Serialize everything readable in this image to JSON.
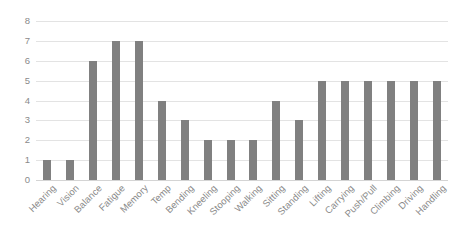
{
  "chart_data": {
    "type": "bar",
    "title": "",
    "subtitle": "",
    "xlabel": "",
    "ylabel": "",
    "categories": [
      "Hearing",
      "Vision",
      "Balance",
      "Fatigue",
      "Memory",
      "Temp",
      "Bending",
      "Kneeling",
      "Stooping",
      "Walking",
      "Sitting",
      "Standing",
      "Lifting",
      "Carrying",
      "Push/Pull",
      "Climbing",
      "Driving",
      "Handling"
    ],
    "values": [
      1,
      1,
      6,
      7,
      7,
      4,
      3,
      2,
      2,
      2,
      4,
      3,
      5,
      5,
      5,
      5,
      5,
      5
    ],
    "ylim": [
      0,
      8
    ],
    "ytick_labels": [
      "8",
      "7",
      "6",
      "5",
      "4",
      "3",
      "2",
      "1",
      "0"
    ],
    "ytick_values": [
      8,
      7,
      6,
      5,
      4,
      3,
      2,
      1,
      0
    ],
    "grid": true,
    "grid_axis": "y",
    "legend": false,
    "legend_position": "none",
    "bar_color": "#808080",
    "grid_color": "#e3e3e3",
    "axis_color": "#d4d4d4",
    "tick_label_color": "#8a8a8a",
    "background_color": "#ffffff",
    "xtick_label_rotation": -45,
    "annotations": []
  }
}
